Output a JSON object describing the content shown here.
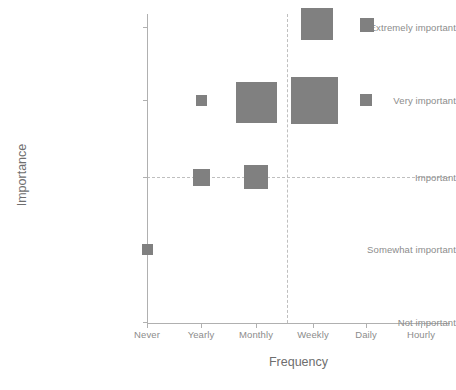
{
  "chart_data": {
    "type": "scatter",
    "title": "",
    "subtitle": "",
    "xlabel": "Frequency",
    "ylabel": "Importance",
    "x_categories": [
      "Never",
      "Yearly",
      "Monthly",
      "Weekly",
      "Daily",
      "Hourly"
    ],
    "y_categories": [
      "Not important",
      "Somewhat important",
      "Important",
      "Very important",
      "Extremely important"
    ],
    "marker_shape": "square",
    "marker_color": "#808080",
    "grid": false,
    "legend": "none",
    "reference_lines": {
      "horizontal_at": "Important",
      "vertical_between": "Monthly-Weekly",
      "style": "dashed"
    },
    "points": [
      {
        "x": "Never",
        "y": "Somewhat important",
        "size": 11
      },
      {
        "x": "Yearly",
        "y": "Important",
        "size": 17
      },
      {
        "x": "Yearly",
        "y": "Very important",
        "size": 11
      },
      {
        "x": "Monthly",
        "y": "Important",
        "size": 24
      },
      {
        "x": "Monthly",
        "y": "Very important",
        "size": 41
      },
      {
        "x": "Weekly",
        "y": "Very important",
        "size": 47
      },
      {
        "x": "Weekly",
        "y": "Extremely important",
        "size": 32
      },
      {
        "x": "Daily",
        "y": "Very important",
        "size": 12
      },
      {
        "x": "Daily",
        "y": "Extremely important",
        "size": 14
      }
    ]
  },
  "axes": {
    "y_label": "Importance",
    "x_label": "Frequency",
    "y_ticks": [
      {
        "label": "Extremely important",
        "top": 27
      },
      {
        "label": "Very important",
        "top": 100
      },
      {
        "label": "Important",
        "top": 177
      },
      {
        "label": "Somewhat important",
        "top": 249
      },
      {
        "label": "Not important",
        "top": 322
      }
    ],
    "x_ticks": [
      {
        "label": "Never",
        "left": 147
      },
      {
        "label": "Yearly",
        "left": 201
      },
      {
        "label": "Monthly",
        "left": 256
      },
      {
        "label": "Weekly",
        "left": 313
      },
      {
        "label": "Daily",
        "left": 366
      },
      {
        "label": "Hourly",
        "left": 421
      }
    ]
  },
  "markers": [
    {
      "name": "never-somewhat-important",
      "left": 147,
      "top": 249,
      "size": 11
    },
    {
      "name": "yearly-very-important",
      "left": 201,
      "top": 100,
      "size": 11
    },
    {
      "name": "yearly-important",
      "left": 201,
      "top": 177,
      "size": 17
    },
    {
      "name": "monthly-very-important",
      "left": 256,
      "top": 102,
      "size": 41
    },
    {
      "name": "monthly-important",
      "left": 256,
      "top": 177,
      "size": 24
    },
    {
      "name": "weekly-extremely-important",
      "left": 317,
      "top": 24,
      "size": 32
    },
    {
      "name": "weekly-very-important",
      "left": 314,
      "top": 100,
      "size": 47
    },
    {
      "name": "daily-extremely-important",
      "left": 367,
      "top": 25,
      "size": 14
    },
    {
      "name": "daily-very-important",
      "left": 366,
      "top": 100,
      "size": 12
    }
  ],
  "style": {
    "marker_color": "#808080",
    "axis_color": "#b0b0b0",
    "tick_text_color": "#8c8c8c",
    "title_text_color": "#6e6e6e",
    "dashed_line_color": "#bfbfbf",
    "background": "#ffffff"
  },
  "reference_lines": {
    "horizontal_top": 177,
    "vertical_left": 287
  }
}
